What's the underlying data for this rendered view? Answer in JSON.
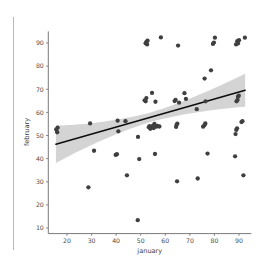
{
  "chart_data": {
    "type": "scatter",
    "title": "",
    "xlabel": "january",
    "ylabel": "february",
    "xlim": [
      13,
      95
    ],
    "ylim": [
      8,
      95
    ],
    "xticks": [
      20,
      30,
      40,
      50,
      60,
      70,
      80,
      90
    ],
    "yticks": [
      10,
      20,
      30,
      40,
      50,
      60,
      70,
      80,
      90
    ],
    "grid": false,
    "legend": null,
    "marker_color": "#3f3f3f",
    "line_color": "#0d0d0d",
    "band_color": "#d2d2d2",
    "regression": {
      "visible": true,
      "x_start": 15.5,
      "y_start": 46.2,
      "x_end": 92.5,
      "y_end": 69.6,
      "ci_band": true,
      "ci_lower_start": 40.0,
      "ci_upper_start": 53.0,
      "ci_lower_end": 64.0,
      "ci_upper_end": 75.5
    },
    "points": [
      [
        15.6,
        52.6
      ],
      [
        16.0,
        51.4
      ],
      [
        16.2,
        53.4
      ],
      [
        28.7,
        27.6
      ],
      [
        29.4,
        55.2
      ],
      [
        31.0,
        43.4
      ],
      [
        39.8,
        41.6
      ],
      [
        40.3,
        41.9
      ],
      [
        40.6,
        56.4
      ],
      [
        40.9,
        51.8
      ],
      [
        43.8,
        56.2
      ],
      [
        44.4,
        32.8
      ],
      [
        48.8,
        13.4
      ],
      [
        48.9,
        49.4
      ],
      [
        49.4,
        39.8
      ],
      [
        51.6,
        65.2
      ],
      [
        52.0,
        64.8
      ],
      [
        52.3,
        66.2
      ],
      [
        52.0,
        89.9
      ],
      [
        52.4,
        90.6
      ],
      [
        52.6,
        89.4
      ],
      [
        52.8,
        91.0
      ],
      [
        53.3,
        53.6
      ],
      [
        53.6,
        54.0
      ],
      [
        53.9,
        52.9
      ],
      [
        54.6,
        68.4
      ],
      [
        54.8,
        53.5
      ],
      [
        55.0,
        54.3
      ],
      [
        55.3,
        53.2
      ],
      [
        55.6,
        55.0
      ],
      [
        55.8,
        42.0
      ],
      [
        56.0,
        64.6
      ],
      [
        56.4,
        53.8
      ],
      [
        56.8,
        54.2
      ],
      [
        58.2,
        92.4
      ],
      [
        57.6,
        53.9
      ],
      [
        63.8,
        64.9
      ],
      [
        64.2,
        65.4
      ],
      [
        64.4,
        53.7
      ],
      [
        64.6,
        54.6
      ],
      [
        64.9,
        55.1
      ],
      [
        64.8,
        30.2
      ],
      [
        65.2,
        88.9
      ],
      [
        65.6,
        64.2
      ],
      [
        67.8,
        68.3
      ],
      [
        68.4,
        65.8
      ],
      [
        72.8,
        61.4
      ],
      [
        73.2,
        31.4
      ],
      [
        75.4,
        53.8
      ],
      [
        75.9,
        54.4
      ],
      [
        76.3,
        55.2
      ],
      [
        76.0,
        74.6
      ],
      [
        76.4,
        64.8
      ],
      [
        77.2,
        42.2
      ],
      [
        79.4,
        89.6
      ],
      [
        79.8,
        90.2
      ],
      [
        80.2,
        92.3
      ],
      [
        78.6,
        78.2
      ],
      [
        88.4,
        41.0
      ],
      [
        88.6,
        50.6
      ],
      [
        88.9,
        52.4
      ],
      [
        89.2,
        53.1
      ],
      [
        89.0,
        64.8
      ],
      [
        89.4,
        65.4
      ],
      [
        89.6,
        66.8
      ],
      [
        89.9,
        67.2
      ],
      [
        88.8,
        89.4
      ],
      [
        89.3,
        90.8
      ],
      [
        89.6,
        89.8
      ],
      [
        90.0,
        91.2
      ],
      [
        91.0,
        55.8
      ],
      [
        91.4,
        56.2
      ],
      [
        91.8,
        32.8
      ],
      [
        92.4,
        92.3
      ]
    ]
  }
}
